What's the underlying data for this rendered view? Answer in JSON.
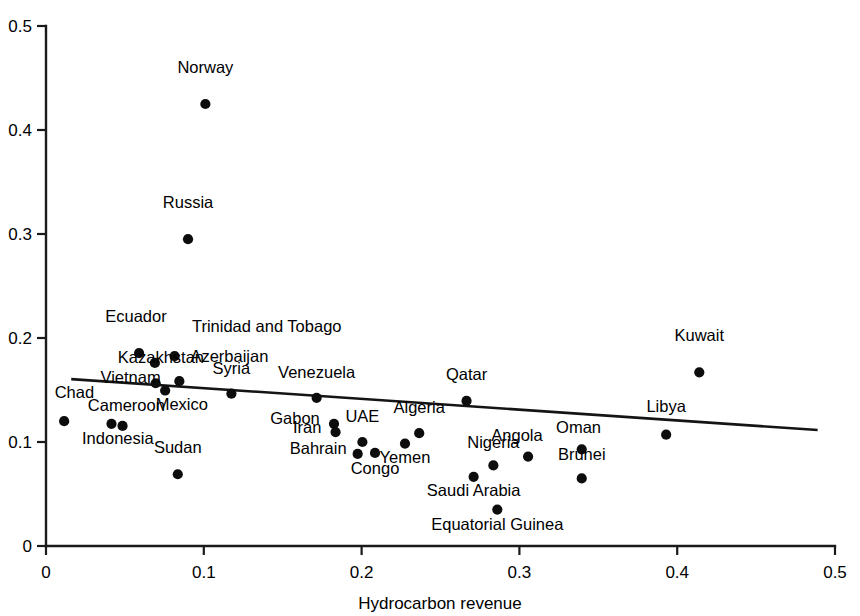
{
  "chart_data": {
    "type": "scatter",
    "title": "",
    "xlabel": "Hydrocarbon revenue",
    "ylabel": "",
    "xlim": [
      0,
      0.5
    ],
    "ylim": [
      0,
      0.5
    ],
    "xticks": [
      "0",
      "0.1",
      "0.2",
      "0.3",
      "0.4",
      "0.5"
    ],
    "xtick_values": [
      0,
      0.1,
      0.2,
      0.3,
      0.4,
      0.5
    ],
    "yticks": [
      "0",
      "0.1",
      "0.2",
      "0.3",
      "0.4",
      "0.5"
    ],
    "ytick_values": [
      0,
      0.1,
      0.2,
      0.3,
      0.4,
      0.5
    ],
    "grid": false,
    "legend": "none",
    "marker_color": "#0d0d0d",
    "line_color": "#141414",
    "axis_color": "#1a1a1a",
    "trendline": {
      "label": "fitted regression line",
      "x0": 0.016,
      "y0": 0.1605,
      "x1": 0.489,
      "y1": 0.1115
    },
    "points": [
      {
        "name": "Norway",
        "x": 0.101,
        "y": 0.425,
        "lx": 0.101,
        "ly": 0.455,
        "anchor": "middle"
      },
      {
        "name": "Russia",
        "x": 0.09,
        "y": 0.295,
        "lx": 0.09,
        "ly": 0.325,
        "anchor": "middle"
      },
      {
        "name": "Kuwait",
        "x": 0.414,
        "y": 0.167,
        "lx": 0.414,
        "ly": 0.197,
        "anchor": "middle"
      },
      {
        "name": "Ecuador",
        "x": 0.059,
        "y": 0.1855,
        "lx": 0.057,
        "ly": 0.2155,
        "anchor": "middle"
      },
      {
        "name": "Trinidad and Tobago",
        "x": 0.0815,
        "y": 0.1825,
        "lx": 0.0925,
        "ly": 0.2055,
        "anchor": "start"
      },
      {
        "name": "Kazakhstan",
        "x": 0.069,
        "y": 0.176,
        "lx": 0.0455,
        "ly": 0.1755,
        "anchor": "start"
      },
      {
        "name": "Azerbaijan",
        "x": 0.0845,
        "y": 0.1585,
        "lx": 0.0915,
        "ly": 0.1765,
        "anchor": "start"
      },
      {
        "name": "Vietnam",
        "x": 0.0695,
        "y": 0.1565,
        "lx": 0.0345,
        "ly": 0.1565,
        "anchor": "start"
      },
      {
        "name": "Syria",
        "x": 0.1175,
        "y": 0.1465,
        "lx": 0.1175,
        "ly": 0.1655,
        "anchor": "middle"
      },
      {
        "name": "Mexico",
        "x": 0.0755,
        "y": 0.1495,
        "lx": 0.0695,
        "ly": 0.131,
        "anchor": "start"
      },
      {
        "name": "Chad",
        "x": 0.0115,
        "y": 0.12,
        "lx": 0.0055,
        "ly": 0.142,
        "anchor": "start"
      },
      {
        "name": "Cameroon",
        "x": 0.0415,
        "y": 0.1175,
        "lx": 0.0265,
        "ly": 0.13,
        "anchor": "start"
      },
      {
        "name": "Indonesia",
        "x": 0.0485,
        "y": 0.1155,
        "lx": 0.0455,
        "ly": 0.0985,
        "anchor": "middle"
      },
      {
        "name": "Sudan",
        "x": 0.0835,
        "y": 0.069,
        "lx": 0.0835,
        "ly": 0.089,
        "anchor": "middle"
      },
      {
        "name": "Venezuela",
        "x": 0.1715,
        "y": 0.1425,
        "lx": 0.1715,
        "ly": 0.162,
        "anchor": "middle"
      },
      {
        "name": "Gabon",
        "x": 0.1825,
        "y": 0.1175,
        "lx": 0.1735,
        "ly": 0.1175,
        "anchor": "end"
      },
      {
        "name": "Iran",
        "x": 0.1835,
        "y": 0.1095,
        "lx": 0.1745,
        "ly": 0.1085,
        "anchor": "end"
      },
      {
        "name": "UAE",
        "x": 0.2005,
        "y": 0.1,
        "lx": 0.2005,
        "ly": 0.119,
        "anchor": "middle"
      },
      {
        "name": "Bahrain",
        "x": 0.1975,
        "y": 0.0885,
        "lx": 0.1905,
        "ly": 0.0885,
        "anchor": "end"
      },
      {
        "name": "Congo",
        "x": 0.2085,
        "y": 0.0895,
        "lx": 0.2085,
        "ly": 0.069,
        "anchor": "middle"
      },
      {
        "name": "Yemen",
        "x": 0.2275,
        "y": 0.0985,
        "lx": 0.2275,
        "ly": 0.0795,
        "anchor": "middle"
      },
      {
        "name": "Algeria",
        "x": 0.2365,
        "y": 0.1085,
        "lx": 0.2365,
        "ly": 0.1275,
        "anchor": "middle"
      },
      {
        "name": "Qatar",
        "x": 0.2665,
        "y": 0.1395,
        "lx": 0.2665,
        "ly": 0.1595,
        "anchor": "middle"
      },
      {
        "name": "Nigeria",
        "x": 0.2835,
        "y": 0.0775,
        "lx": 0.2835,
        "ly": 0.094,
        "anchor": "middle"
      },
      {
        "name": "Saudi Arabia",
        "x": 0.271,
        "y": 0.0665,
        "lx": 0.271,
        "ly": 0.048,
        "anchor": "middle"
      },
      {
        "name": "Equatorial Guinea",
        "x": 0.286,
        "y": 0.035,
        "lx": 0.286,
        "ly": 0.0155,
        "anchor": "middle"
      },
      {
        "name": "Angola",
        "x": 0.3055,
        "y": 0.086,
        "lx": 0.2985,
        "ly": 0.1005,
        "anchor": "middle"
      },
      {
        "name": "Oman",
        "x": 0.3395,
        "y": 0.093,
        "lx": 0.3375,
        "ly": 0.109,
        "anchor": "middle"
      },
      {
        "name": "Brunei",
        "x": 0.3395,
        "y": 0.065,
        "lx": 0.3395,
        "ly": 0.083,
        "anchor": "middle"
      },
      {
        "name": "Libya",
        "x": 0.393,
        "y": 0.107,
        "lx": 0.393,
        "ly": 0.129,
        "anchor": "middle"
      }
    ]
  }
}
